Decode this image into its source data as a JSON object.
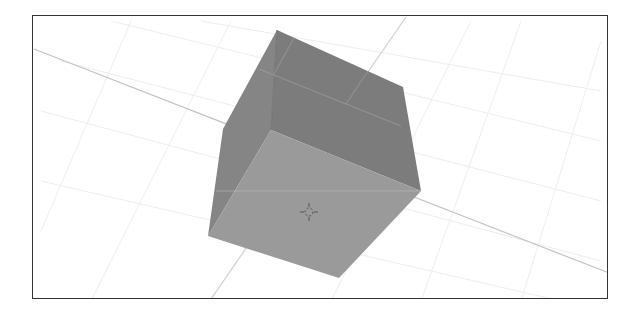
{
  "viewport": {
    "background": "#ffffff",
    "border_color": "#333333"
  },
  "scene": {
    "object": "cube",
    "colors": {
      "front_face": "#999999",
      "side_face": "#7f7f7f",
      "top_face": "#8a8a8a",
      "axis_line": "#c8c8c8",
      "grid_line": "#eeeeee"
    },
    "cursor_icon": "3d-cursor-icon"
  }
}
